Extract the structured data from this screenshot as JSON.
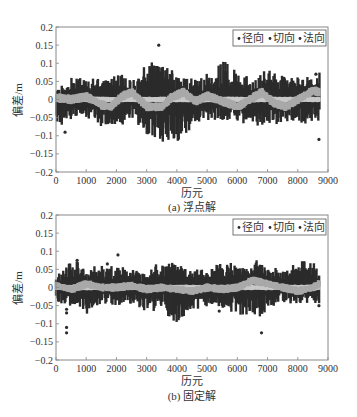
{
  "chart_data": [
    {
      "id": "a",
      "type": "scatter",
      "caption": "(a) 浮点解",
      "xlabel": "历元",
      "ylabel": "偏差/m",
      "xlim": [
        0,
        9000
      ],
      "ylim": [
        -0.2,
        0.2
      ],
      "xticks": [
        0,
        1000,
        2000,
        3000,
        4000,
        5000,
        6000,
        7000,
        8000,
        9000
      ],
      "xtick_labels": [
        "0",
        "1000",
        "2000",
        "3000",
        "4000",
        "5000",
        "6000",
        "7000",
        "8000",
        "9000"
      ],
      "yticks": [
        -0.2,
        -0.15,
        -0.1,
        -0.05,
        0,
        0.05,
        0.1,
        0.15,
        0.2
      ],
      "ytick_labels": [
        "-0.2",
        "-0.15",
        "-0.1",
        "-0.05",
        "0",
        "0.05",
        "0.1",
        "0.15",
        "0.2"
      ],
      "grid": false,
      "legend": {
        "placement": "top-right",
        "entries": [
          "径向",
          "切向",
          "法向"
        ]
      },
      "epoch_count": 8700,
      "series": [
        {
          "name": "径向",
          "color": "#2b2b2b",
          "description": "dense dark scatter, envelope approx",
          "envelope_x": [
            0,
            500,
            1000,
            1500,
            2000,
            2500,
            3000,
            3500,
            4000,
            4500,
            5000,
            5500,
            6000,
            6500,
            7000,
            7500,
            8000,
            8500,
            8700
          ],
          "envelope_upper": [
            0.03,
            0.06,
            0.06,
            0.05,
            0.08,
            0.05,
            0.1,
            0.1,
            0.07,
            0.06,
            0.07,
            0.11,
            0.07,
            0.06,
            0.08,
            0.07,
            0.06,
            0.07,
            0.09
          ],
          "envelope_lower": [
            -0.07,
            -0.06,
            -0.05,
            -0.07,
            -0.08,
            -0.05,
            -0.1,
            -0.12,
            -0.12,
            -0.08,
            -0.06,
            -0.06,
            -0.06,
            -0.08,
            -0.08,
            -0.06,
            -0.06,
            -0.07,
            -0.06
          ],
          "outliers": [
            [
              300,
              -0.09
            ],
            [
              3400,
              0.15
            ],
            [
              3150,
              -0.05
            ],
            [
              8700,
              -0.11
            ],
            [
              8600,
              0.07
            ]
          ]
        },
        {
          "name": "切向",
          "color": "#a9a9a9",
          "description": "light gray band around trend",
          "trend_x": [
            0,
            500,
            1000,
            1500,
            1800,
            2200,
            2500,
            3000,
            3500,
            3800,
            4200,
            4600,
            5000,
            5500,
            6000,
            6500,
            6800,
            7200,
            7600,
            8000,
            8500,
            8700
          ],
          "trend_y": [
            0.005,
            0.0,
            0.008,
            -0.015,
            -0.02,
            0.01,
            0.02,
            -0.02,
            -0.02,
            0.005,
            0.02,
            -0.005,
            0.01,
            -0.005,
            -0.02,
            0.005,
            0.02,
            -0.01,
            -0.02,
            0.0,
            0.025,
            0.02
          ],
          "band_halfwidth": 0.01
        },
        {
          "name": "法向",
          "color": "#c8c8c8",
          "description": "overlaps tangential band (light gray)",
          "trend_x": [
            0,
            4350,
            8700
          ],
          "trend_y": [
            0,
            0,
            0
          ],
          "band_halfwidth": 0.006
        }
      ]
    },
    {
      "id": "b",
      "type": "scatter",
      "caption": "(b) 固定解",
      "xlabel": "历元",
      "ylabel": "偏差/m",
      "xlim": [
        0,
        9000
      ],
      "ylim": [
        -0.2,
        0.2
      ],
      "xticks": [
        0,
        1000,
        2000,
        3000,
        4000,
        5000,
        6000,
        7000,
        8000,
        9000
      ],
      "xtick_labels": [
        "0",
        "1000",
        "2000",
        "3000",
        "4000",
        "5000",
        "6000",
        "7000",
        "8000",
        "9000"
      ],
      "yticks": [
        -0.2,
        -0.15,
        -0.1,
        -0.05,
        0,
        0.05,
        0.1,
        0.15,
        0.2
      ],
      "ytick_labels": [
        "-0.2",
        "-0.15",
        "-0.1",
        "-0.05",
        "0",
        "0.05",
        "0.1",
        "0.15",
        "0.2"
      ],
      "grid": false,
      "legend": {
        "placement": "top-right",
        "entries": [
          "径向",
          "切向",
          "法向"
        ]
      },
      "epoch_count": 8700,
      "series": [
        {
          "name": "径向",
          "color": "#2b2b2b",
          "description": "dense dark scatter, envelope approx",
          "envelope_x": [
            0,
            500,
            1000,
            1500,
            2000,
            2500,
            3000,
            3500,
            4000,
            4500,
            5000,
            5500,
            6000,
            6500,
            7000,
            7500,
            8000,
            8500,
            8700
          ],
          "envelope_upper": [
            0.04,
            0.08,
            0.05,
            0.06,
            0.06,
            0.05,
            0.04,
            0.08,
            0.06,
            0.05,
            0.05,
            0.07,
            0.06,
            0.08,
            0.06,
            0.05,
            0.07,
            0.08,
            0.06
          ],
          "envelope_lower": [
            -0.04,
            -0.05,
            -0.08,
            -0.04,
            -0.05,
            -0.04,
            -0.07,
            -0.05,
            -0.12,
            -0.06,
            -0.05,
            -0.06,
            -0.07,
            -0.09,
            -0.06,
            -0.04,
            -0.05,
            -0.05,
            -0.05
          ],
          "outliers": [
            [
              350,
              -0.06
            ],
            [
              350,
              -0.07
            ],
            [
              350,
              -0.11
            ],
            [
              350,
              -0.125
            ],
            [
              2050,
              0.09
            ],
            [
              1700,
              0.065
            ],
            [
              700,
              0.075
            ],
            [
              6800,
              -0.125
            ],
            [
              5400,
              -0.065
            ],
            [
              8700,
              -0.05
            ]
          ]
        },
        {
          "name": "切向",
          "color": "#a9a9a9",
          "description": "light gray band around trend",
          "trend_x": [
            0,
            500,
            1000,
            1500,
            2000,
            2500,
            3000,
            3500,
            4000,
            4500,
            5000,
            5500,
            6000,
            6500,
            7000,
            7500,
            8000,
            8500,
            8700
          ],
          "trend_y": [
            0.005,
            -0.005,
            0.01,
            0.0,
            0.0,
            0.005,
            -0.005,
            0.0,
            -0.005,
            -0.01,
            0.0,
            -0.005,
            0.0,
            0.02,
            0.01,
            0.0,
            -0.01,
            0.0,
            0.01
          ],
          "band_halfwidth": 0.009
        },
        {
          "name": "法向",
          "color": "#c8c8c8",
          "description": "overlaps tangential band (light gray)",
          "trend_x": [
            0,
            4350,
            8700
          ],
          "trend_y": [
            0,
            0,
            0
          ],
          "band_halfwidth": 0.006
        }
      ]
    }
  ]
}
